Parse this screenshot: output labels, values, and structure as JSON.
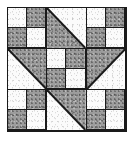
{
  "image": {
    "title": "Pieced Quilt Block Diagram",
    "description": "Nine-patch quilt block: four-patch checkerboard units at the corners and center, half-square triangle units along the edges forming a diagonal band",
    "width": 135,
    "height": 141,
    "background_color": "#ffffff"
  },
  "block": {
    "name": "quilt-block",
    "grid_rows": 3,
    "grid_columns": 3,
    "outline_color": "#1a1a1a",
    "light_fabric_color": "#fbfbfb",
    "dark_fabric_color": "#9c9c9c",
    "light_fabric_label": "light solid fabric",
    "dark_fabric_label": "dark mottled fabric"
  },
  "units": [
    {
      "position": "top-left",
      "row": 1,
      "column": 1,
      "type": "four-patch",
      "name": "four-patch-top-left",
      "patches": [
        "light",
        "dark",
        "dark",
        "light"
      ]
    },
    {
      "position": "top-center",
      "row": 1,
      "column": 2,
      "type": "half-square-triangle",
      "name": "hst-top-center",
      "dark_corner": "south-west",
      "light_corner": "north-east"
    },
    {
      "position": "top-right",
      "row": 1,
      "column": 3,
      "type": "four-patch",
      "name": "four-patch-top-right",
      "patches": [
        "light",
        "dark",
        "dark",
        "light"
      ]
    },
    {
      "position": "middle-left",
      "row": 2,
      "column": 1,
      "type": "half-square-triangle",
      "name": "hst-middle-left",
      "dark_corner": "north-east",
      "light_corner": "south-west"
    },
    {
      "position": "center",
      "row": 2,
      "column": 2,
      "type": "four-patch",
      "name": "four-patch-center",
      "patches": [
        "light",
        "dark",
        "dark",
        "light"
      ]
    },
    {
      "position": "middle-right",
      "row": 2,
      "column": 3,
      "type": "half-square-triangle",
      "name": "hst-middle-right",
      "dark_corner": "north-west",
      "light_corner": "south-east"
    },
    {
      "position": "bottom-left",
      "row": 3,
      "column": 1,
      "type": "four-patch",
      "name": "four-patch-bottom-left",
      "patches": [
        "light",
        "dark",
        "dark",
        "light"
      ]
    },
    {
      "position": "bottom-center",
      "row": 3,
      "column": 2,
      "type": "half-square-triangle",
      "name": "hst-bottom-center",
      "dark_corner": "north-east",
      "light_corner": "south-west"
    },
    {
      "position": "bottom-right",
      "row": 3,
      "column": 3,
      "type": "four-patch",
      "name": "four-patch-bottom-right",
      "patches": [
        "light",
        "dark",
        "dark",
        "light"
      ]
    }
  ]
}
